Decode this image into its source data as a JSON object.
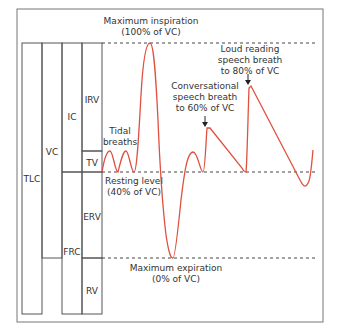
{
  "diagram": {
    "colors": {
      "curve": "#e05040",
      "frame": "#555555",
      "dashed": "#444444",
      "text": "#333333"
    },
    "volume_boxes": {
      "tlc": "TLC",
      "vc": "VC",
      "ic": "IC",
      "frc": "FRC",
      "irv": "IRV",
      "tv": "TV",
      "erv": "ERV",
      "rv": "RV"
    },
    "levels": {
      "max_inspiration": {
        "line1": "Maximum inspiration",
        "line2": "(100% of VC)"
      },
      "resting": {
        "line1": "Resting level",
        "line2": "(40% of VC)"
      },
      "max_expiration": {
        "line1": "Maximum expiration",
        "line2": "(0% of VC)"
      }
    },
    "annotations": {
      "tidal": {
        "line1": "Tidal",
        "line2": "breaths"
      },
      "conversational": {
        "line1": "Conversational",
        "line2": "speech breath",
        "line3": "to 60% of VC"
      },
      "loud": {
        "line1": "Loud reading",
        "line2": "speech breath",
        "line3": "to 80% of VC"
      }
    }
  }
}
